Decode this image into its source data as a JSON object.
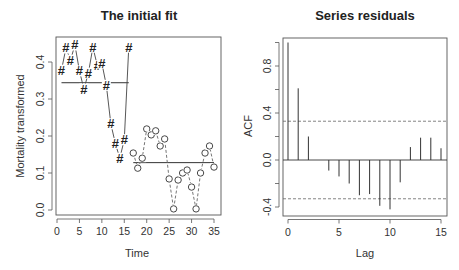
{
  "chart_data": [
    {
      "type": "line",
      "title": "The initial fit",
      "xlabel": "Time",
      "ylabel": "Mortality transformed",
      "xlim": [
        0,
        35
      ],
      "ylim": [
        0.0,
        0.45
      ],
      "x_ticks": [
        0,
        5,
        10,
        15,
        20,
        25,
        30,
        35
      ],
      "y_ticks": [
        0.0,
        0.1,
        0.2,
        0.3,
        0.4
      ],
      "y_tick_labels": [
        "0.0",
        "0.1",
        "0.2",
        "0.3",
        "0.4"
      ],
      "grid": false,
      "series": [
        {
          "name": "segment 1",
          "marker": "#",
          "line_style": "solid",
          "x": [
            1,
            2,
            3,
            4,
            5,
            6,
            7,
            8,
            9,
            10,
            11,
            12,
            13,
            14,
            15,
            16
          ],
          "values": [
            0.378,
            0.438,
            0.405,
            0.446,
            0.376,
            0.327,
            0.37,
            0.44,
            0.39,
            0.397,
            0.337,
            0.233,
            0.18,
            0.14,
            0.19,
            0.44
          ]
        },
        {
          "name": "segment 2",
          "marker": "o",
          "line_style": "dashed",
          "x": [
            17,
            18,
            19,
            20,
            21,
            22,
            23,
            24,
            25,
            26,
            27,
            28,
            29,
            30,
            31,
            32,
            33,
            34,
            35
          ],
          "values": [
            0.154,
            0.113,
            0.14,
            0.219,
            0.203,
            0.214,
            0.173,
            0.192,
            0.084,
            0.003,
            0.081,
            0.1,
            0.108,
            0.062,
            0.003,
            0.1,
            0.154,
            0.173,
            0.116
          ]
        }
      ],
      "fit_lines": [
        {
          "x": [
            1,
            16
          ],
          "value": 0.344
        },
        {
          "x": [
            17,
            35
          ],
          "value": 0.128
        }
      ]
    },
    {
      "type": "bar",
      "subtype": "acf",
      "title": "Series residuals",
      "xlabel": "Lag",
      "ylabel": "ACF",
      "xlim": [
        0,
        15
      ],
      "ylim": [
        -0.45,
        1.0
      ],
      "x_ticks": [
        0,
        5,
        10,
        15
      ],
      "y_ticks": [
        -0.4,
        0.0,
        0.4,
        0.8
      ],
      "y_tick_labels": [
        "-0.4",
        "0.0",
        "0.4",
        "0.8"
      ],
      "y_minor_ticks": [
        -0.2,
        0.2,
        0.6,
        1.0
      ],
      "grid": false,
      "categories": [
        0,
        1,
        2,
        3,
        4,
        5,
        6,
        7,
        8,
        9,
        10,
        11,
        12,
        13,
        14,
        15
      ],
      "values": [
        1.0,
        0.61,
        0.2,
        0.0,
        -0.09,
        -0.14,
        -0.2,
        -0.3,
        -0.29,
        -0.39,
        -0.42,
        -0.19,
        0.11,
        0.19,
        0.19,
        0.1
      ],
      "confidence_bounds": [
        0.33,
        -0.33
      ]
    }
  ]
}
